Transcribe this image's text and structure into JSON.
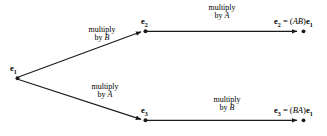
{
  "diagram": {
    "stroke_color": "#1a1a1a",
    "background_color": "#ffffff",
    "nodes": [
      {
        "id": "e1",
        "label": "e",
        "sub": "1",
        "x": 17,
        "y": 78
      },
      {
        "id": "e2",
        "label": "e",
        "sub": "2",
        "x": 145,
        "y": 31
      },
      {
        "id": "e3",
        "label": "e",
        "sub": "3",
        "x": 145,
        "y": 120
      }
    ],
    "edges": [
      {
        "id": "e1-to-e2",
        "from": "e1",
        "to": "e2",
        "caption_line1": "multiply",
        "caption_line2_prefix": "by ",
        "caption_line2_matrix": "B"
      },
      {
        "id": "e1-to-e3",
        "from": "e1",
        "to": "e3",
        "caption_line1": "multiply",
        "caption_line2_prefix": "by ",
        "caption_line2_matrix": "A"
      },
      {
        "id": "e2-to-result-ab",
        "from": "e2",
        "to": "result-ab",
        "caption_line1": "multiply",
        "caption_line2_prefix": "by ",
        "caption_line2_matrix": "A"
      },
      {
        "id": "e3-to-result-ba",
        "from": "e3",
        "to": "result-ba",
        "caption_line1": "multiply",
        "caption_line2_prefix": "by ",
        "caption_line2_matrix": "B"
      }
    ],
    "results": [
      {
        "id": "result-ab",
        "vector": "e",
        "vector_sub": "2",
        "equals": " = (",
        "matrix": "AB",
        "close": ")",
        "operand": "e",
        "operand_sub": "1",
        "x": 275,
        "y": 31
      },
      {
        "id": "result-ba",
        "vector": "e",
        "vector_sub": "3",
        "equals": " = (",
        "matrix": "BA",
        "close": ")",
        "operand": "e",
        "operand_sub": "1",
        "x": 275,
        "y": 120
      }
    ]
  }
}
